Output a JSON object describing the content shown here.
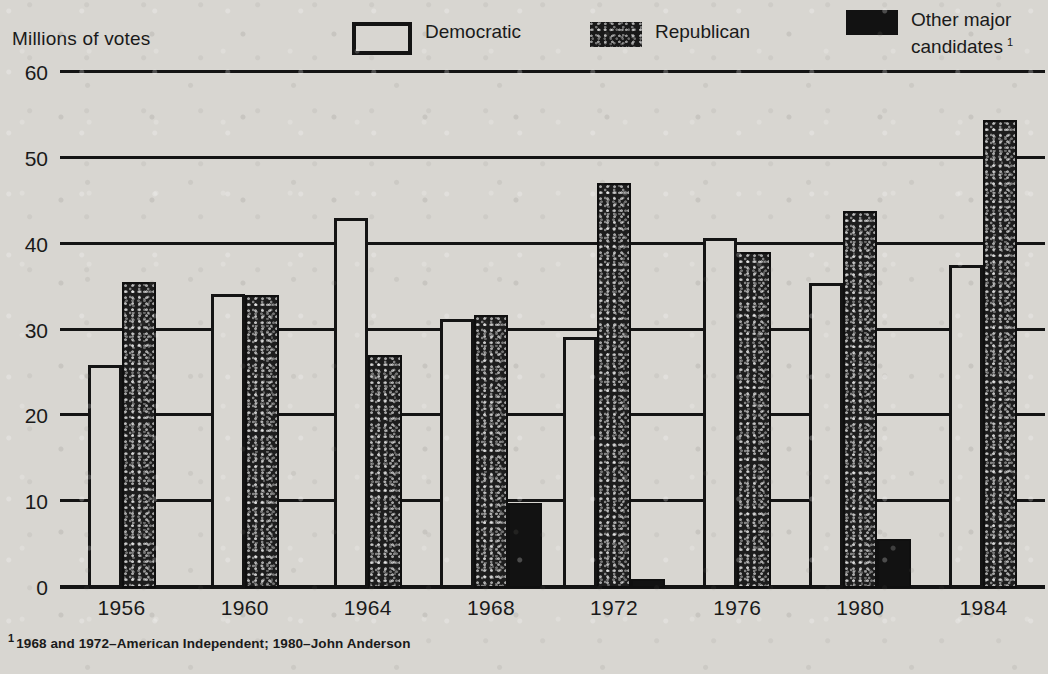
{
  "axis_title": "Millions of votes",
  "legend": {
    "items": [
      {
        "label": "Democratic",
        "swatch": "outline-white",
        "color": "#d8d6d1"
      },
      {
        "label": "Republican",
        "swatch": "stippled-dark",
        "color": "#1d1d1d"
      },
      {
        "label": "Other major\ncandidates",
        "swatch": "solid-black",
        "color": "#121212",
        "footnote_marker": "1"
      }
    ]
  },
  "footnote": {
    "marker": "1",
    "text": "1968 and 1972–American Independent; 1980–John Anderson"
  },
  "chart_data": {
    "type": "bar",
    "title": "",
    "subtitle": "",
    "xlabel": "",
    "ylabel": "Millions of votes",
    "ylim": [
      0,
      60
    ],
    "yticks": [
      0,
      10,
      20,
      30,
      40,
      50,
      60
    ],
    "ytick_labels": [
      "0",
      "10",
      "20",
      "30",
      "40",
      "50",
      "60"
    ],
    "grid": true,
    "legend_position": "top-right",
    "categories": [
      "1956",
      "1960",
      "1964",
      "1968",
      "1972",
      "1976",
      "1980",
      "1984"
    ],
    "series": [
      {
        "name": "Democratic",
        "color": "#d8d6d1",
        "values": [
          26.0,
          34.2,
          43.1,
          31.3,
          29.2,
          40.8,
          35.5,
          37.6
        ]
      },
      {
        "name": "Republican",
        "color": "#1d1d1d",
        "values": [
          35.6,
          34.1,
          27.2,
          31.8,
          47.2,
          39.1,
          43.9,
          54.5
        ]
      },
      {
        "name": "Other major candidates",
        "color": "#121212",
        "values": [
          null,
          null,
          null,
          9.9,
          1.1,
          null,
          5.7,
          null
        ]
      }
    ]
  }
}
